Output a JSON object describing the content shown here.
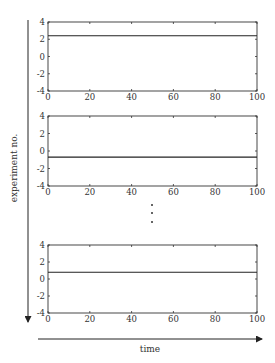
{
  "diagram": {
    "y_axis_label": "experiment no.",
    "x_axis_label": "time",
    "ellipsis": "⋮"
  },
  "chart_data": [
    {
      "type": "line",
      "title": "",
      "xlabel": "",
      "ylabel": "",
      "xlim": [
        0,
        100
      ],
      "ylim": [
        -4,
        4
      ],
      "xticks": [
        "0",
        "20",
        "40",
        "60",
        "80",
        "100"
      ],
      "yticks": [
        "4",
        "2",
        "0",
        "-2",
        "-4"
      ],
      "series": [
        {
          "name": "experiment 1",
          "x": [
            0,
            100
          ],
          "values": [
            2.4,
            2.4
          ]
        }
      ]
    },
    {
      "type": "line",
      "title": "",
      "xlabel": "",
      "ylabel": "",
      "xlim": [
        0,
        100
      ],
      "ylim": [
        -4,
        4
      ],
      "xticks": [
        "0",
        "20",
        "40",
        "60",
        "80",
        "100"
      ],
      "yticks": [
        "4",
        "2",
        "0",
        "-2",
        "-4"
      ],
      "series": [
        {
          "name": "experiment 2",
          "x": [
            0,
            100
          ],
          "values": [
            -0.7,
            -0.7
          ]
        }
      ]
    },
    {
      "type": "line",
      "title": "",
      "xlabel": "",
      "ylabel": "",
      "xlim": [
        0,
        100
      ],
      "ylim": [
        -4,
        4
      ],
      "xticks": [
        "0",
        "20",
        "40",
        "60",
        "80",
        "100"
      ],
      "yticks": [
        "4",
        "2",
        "0",
        "-2",
        "-4"
      ],
      "series": [
        {
          "name": "experiment n",
          "x": [
            0,
            100
          ],
          "values": [
            0.8,
            0.8
          ]
        }
      ]
    }
  ]
}
